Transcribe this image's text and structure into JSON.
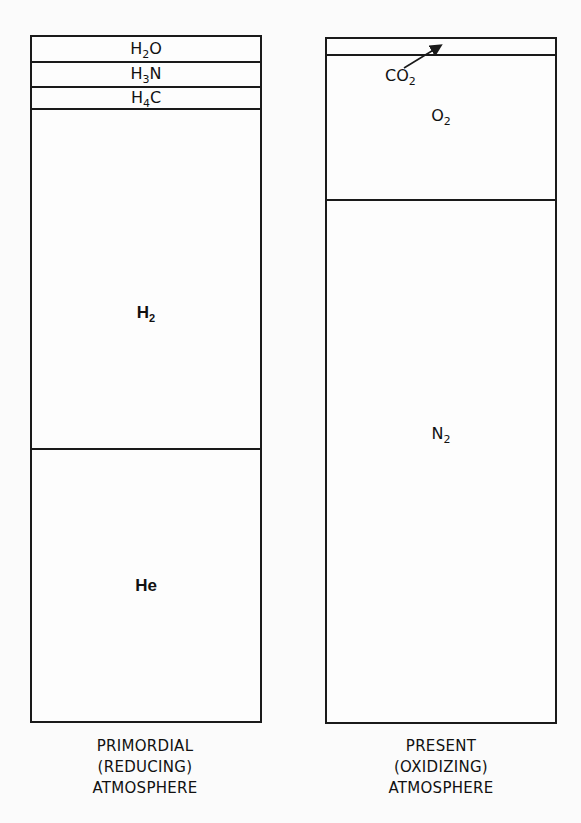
{
  "diagram": {
    "type": "stacked composition columns",
    "columns": [
      {
        "id": "primordial",
        "caption": [
          "PRIMORDIAL",
          "(REDUCING)",
          "ATMOSPHERE"
        ],
        "layers_top_to_bottom": [
          {
            "formula": "H2O",
            "base": "H",
            "sub": "2",
            "tail": "O",
            "relative_height": 25
          },
          {
            "formula": "H3N",
            "base": "H",
            "sub": "3",
            "tail": "N",
            "relative_height": 25
          },
          {
            "formula": "H4C",
            "base": "H",
            "sub": "4",
            "tail": "C",
            "relative_height": 22
          },
          {
            "formula": "H2",
            "base": "H",
            "sub": "2",
            "tail": "",
            "relative_height": 340
          },
          {
            "formula": "He",
            "base": "He",
            "sub": "",
            "tail": "",
            "relative_height": 275
          }
        ]
      },
      {
        "id": "present",
        "caption": [
          "PRESENT",
          "(OXIDIZING)",
          "ATMOSPHERE"
        ],
        "layers_top_to_bottom": [
          {
            "formula": "CO2",
            "relative_height": 17,
            "label_outside": true
          },
          {
            "formula": "O2",
            "base": "O",
            "sub": "2",
            "tail": "",
            "relative_height": 145
          },
          {
            "formula": "N2",
            "base": "N",
            "sub": "2",
            "tail": "",
            "relative_height": 524
          }
        ],
        "annotation": {
          "text_base": "CO",
          "text_sub": "2",
          "arrow_target": "top layer"
        }
      }
    ],
    "colors": {
      "line": "#1a1a1a",
      "background": "#fbfbfb",
      "text": "#111111"
    }
  }
}
